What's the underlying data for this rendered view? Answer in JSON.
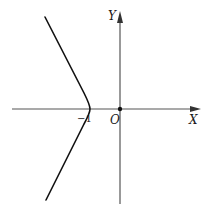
{
  "diagram": {
    "type": "coordinate-plot",
    "axes": {
      "x_label": "X",
      "y_label": "Y",
      "origin_label": "O"
    },
    "tick_labels": {
      "vertex_x": "−1"
    },
    "curve": {
      "name": "hyperbola-left-branch",
      "vertex": [
        -1,
        0
      ]
    },
    "colors": {
      "axis": "#555555",
      "curve": "#111111",
      "background": "#ffffff"
    }
  }
}
